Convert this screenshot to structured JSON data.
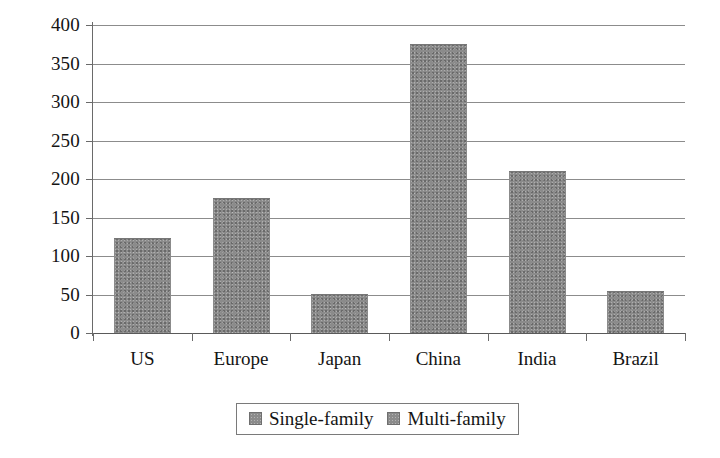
{
  "chart_data": {
    "type": "bar",
    "title": "",
    "xlabel": "",
    "ylabel": "",
    "categories": [
      "US",
      "Europe",
      "Japan",
      "China",
      "India",
      "Brazil"
    ],
    "values": [
      122,
      174,
      49,
      374,
      209,
      53
    ],
    "series": [
      {
        "name": "Single-family",
        "values": [
          122,
          174,
          49,
          374,
          209,
          53
        ]
      }
    ],
    "ylim": [
      0,
      400
    ],
    "yticks": [
      0,
      50,
      100,
      150,
      200,
      250,
      300,
      350,
      400
    ],
    "ytick_labels": [
      "0",
      "50",
      "100",
      "150",
      "200",
      "250",
      "300",
      "350",
      "400"
    ],
    "grid": true,
    "legend_position": "bottom-center",
    "legend": [
      {
        "label": "Single-family",
        "color": "#8b8b8b"
      },
      {
        "label": "Multi-family",
        "color": "#8b8b8b"
      }
    ],
    "bar_color": "#8b8b8b",
    "gridline_color": "#8c8c8c",
    "axis_color": "#5a5a5a",
    "background_color": "#ffffff"
  }
}
